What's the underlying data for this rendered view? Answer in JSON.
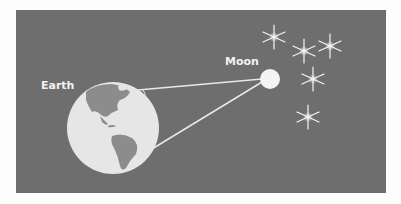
{
  "diagram": {
    "labels": {
      "earth": "Earth",
      "moon": "Moon"
    },
    "colors": {
      "background": "#6e6e6e",
      "page": "#fdfdfd",
      "earth_ocean": "#e6e6e6",
      "earth_land": "#8c8c8c",
      "moon": "#f4f4f4",
      "lines": "#e8e8e8",
      "stars": "#f5f5f5"
    },
    "stars_count": 5
  }
}
